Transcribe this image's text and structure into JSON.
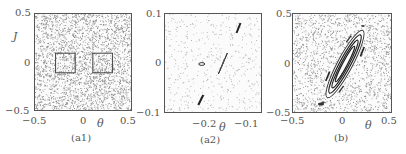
{
  "figure": {
    "panels": [
      {
        "id": "a1",
        "caption": "(a1)",
        "xlabel": "θ",
        "ylabel": "J",
        "xticks": [
          "−0.5",
          "0",
          "0.5"
        ],
        "yticks": [
          "0.5",
          "0",
          "−0.5"
        ]
      },
      {
        "id": "a2",
        "caption": "(a2)",
        "xlabel": "θ",
        "ylabel": "",
        "xticks": [
          "−0.2",
          "−0.1"
        ],
        "yticks": [
          "0.1",
          "0",
          "−0.1"
        ]
      },
      {
        "id": "b",
        "caption": "(b)",
        "xlabel": "θ",
        "ylabel": "",
        "xticks": [
          "−0.5",
          "0",
          "0.5"
        ],
        "yticks": [
          "0.5",
          "0",
          "−0.5"
        ]
      }
    ]
  },
  "chart_data": [
    {
      "type": "scatter",
      "title": "(a1)",
      "xlabel": "θ",
      "ylabel": "J",
      "xlim": [
        -0.5,
        0.5
      ],
      "ylim": [
        -0.5,
        0.5
      ],
      "grid": false,
      "description": "Dense chaotic sea of points filling the whole square; two small square boxes outlined at θ∈[-0.29,-0.09], J∈[-0.1,0.1] and θ∈[0.09,0.29], J∈[-0.1,0.1] (zoom regions).",
      "annotations": [
        {
          "shape": "rect",
          "x": [
            -0.29,
            -0.09
          ],
          "y": [
            -0.1,
            0.1
          ]
        },
        {
          "shape": "rect",
          "x": [
            0.09,
            0.29
          ],
          "y": [
            -0.1,
            0.1
          ]
        }
      ]
    },
    {
      "type": "scatter",
      "title": "(a2)",
      "xlabel": "θ",
      "ylabel": "",
      "xlim": [
        -0.29,
        -0.09
      ],
      "ylim": [
        -0.1,
        0.1
      ],
      "grid": false,
      "description": "Sparse chaotic points with small regular islands: a small elongated ellipse near (-0.215, 0), a thin diamond near (-0.175, 0), and short diagonal strokes near (-0.14, 0.07) and (-0.215, -0.07).",
      "islands": [
        {
          "center": [
            -0.215,
            0.0
          ],
          "shape": "small ellipse"
        },
        {
          "center": [
            -0.175,
            0.0
          ],
          "shape": "thin diamond"
        },
        {
          "center": [
            -0.14,
            0.072
          ],
          "shape": "diagonal stroke"
        },
        {
          "center": [
            -0.217,
            -0.072
          ],
          "shape": "diagonal stroke"
        }
      ]
    },
    {
      "type": "scatter",
      "title": "(b)",
      "xlabel": "θ",
      "ylabel": "",
      "xlim": [
        -0.5,
        0.5
      ],
      "ylim": [
        -0.5,
        0.5
      ],
      "grid": false,
      "description": "Chaotic sea with a large elongated regular island tilted along the diagonal from about (-0.15,-0.35) to (0.2,0.35), containing nested elongated contours, plus small satellite islands near (-0.22,-0.4) and (0.2,0.35).",
      "islands": [
        {
          "center": [
            0.0,
            0.0
          ],
          "shape": "nested elongated ellipses",
          "extent": [
            [
              -0.15,
              -0.35
            ],
            [
              0.2,
              0.35
            ]
          ]
        },
        {
          "center": [
            -0.22,
            -0.4
          ],
          "shape": "small cluster"
        },
        {
          "center": [
            0.2,
            0.35
          ],
          "shape": "small cluster"
        }
      ]
    }
  ]
}
